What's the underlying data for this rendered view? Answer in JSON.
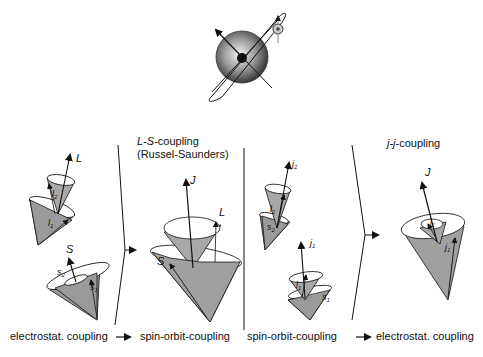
{
  "diagram": {
    "top_figure": "atom with nucleus, orbiting electron with spin",
    "panels": [
      {
        "id": "initial-left",
        "labels": [
          "L",
          "l2",
          "l1",
          "S",
          "s2",
          "s1"
        ]
      },
      {
        "id": "ls-coupling",
        "title_italic": "L-S",
        "title_rest": "-coupling",
        "subtitle": "(Russel-Saunders)",
        "labels": [
          "J",
          "L",
          "S"
        ]
      },
      {
        "id": "initial-right",
        "labels": [
          "j2",
          "l2",
          "s2",
          "j1",
          "l1",
          "s1"
        ]
      },
      {
        "id": "jj-coupling",
        "title_italic": "j-j",
        "title_rest": "-coupling",
        "labels": [
          "J",
          "j2",
          "j1"
        ]
      }
    ],
    "captions": {
      "left_from": "electrostat. coupling",
      "left_to": "spin-orbit-coupling",
      "right_from": "spin-orbit-coupling",
      "right_to": "electrostat. coupling",
      "arrow": "→"
    },
    "vector_labels": {
      "L": "L",
      "S": "S",
      "J": "J",
      "l": "l",
      "s": "s",
      "j": "j",
      "sub1": "1",
      "sub2": "2"
    }
  }
}
